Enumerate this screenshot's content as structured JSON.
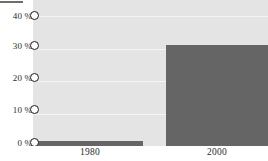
{
  "chart_data": {
    "type": "bar",
    "title": "",
    "subtitle": "",
    "xlabel": "",
    "ylabel": "",
    "categories": [
      "1980",
      "2000"
    ],
    "values": [
      1.5,
      31
    ],
    "series": [
      {
        "name": "share",
        "values": [
          1.5,
          31
        ]
      }
    ],
    "ylim": [
      0,
      45
    ],
    "yticks": [
      0,
      10,
      20,
      30,
      40
    ],
    "ytick_labels": [
      "0 %",
      "10 %",
      "20 %",
      "30 %",
      "40 %"
    ],
    "grid": true,
    "legend": "none",
    "annotations": []
  },
  "axes": {
    "y": {
      "ticks": [
        {
          "label": "40 %",
          "value": 40
        },
        {
          "label": "30 %",
          "value": 30
        },
        {
          "label": "20 %",
          "value": 20
        },
        {
          "label": "10 %",
          "value": 10
        },
        {
          "label": "0 %",
          "value": 0
        }
      ]
    },
    "x": {
      "ticks": [
        {
          "label": "1980"
        },
        {
          "label": "2000"
        }
      ]
    }
  },
  "colors": {
    "bar": "#656565",
    "plot_background": "#e4e4e4",
    "gridline": "#f4f4f4",
    "page_background": "#ffffff",
    "label_text": "#2b2b2b",
    "tick_marker_stroke": "#1c1c1c"
  }
}
